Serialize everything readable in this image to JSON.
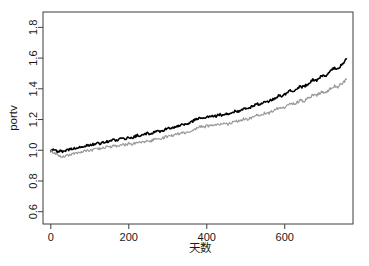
{
  "chart_data": {
    "type": "line",
    "title": "",
    "xlabel": "天数",
    "ylabel": "portv",
    "xlim": [
      -20,
      775
    ],
    "ylim": [
      0.52,
      1.9
    ],
    "xticks": [
      0,
      200,
      400,
      600
    ],
    "xtick_labels": [
      "0",
      "200",
      "400",
      "600"
    ],
    "yticks": [
      0.6,
      0.8,
      1.0,
      1.2,
      1.4,
      1.6,
      1.8
    ],
    "ytick_labels": [
      "0.6",
      "0.8",
      "1.0",
      "1.2",
      "1.4",
      "1.6",
      "1.8"
    ],
    "grid": false,
    "legend": "none",
    "box": true,
    "series": [
      {
        "name": "portv-black",
        "color": "#000000",
        "width": 1.6,
        "x": [
          0,
          8,
          16,
          24,
          32,
          40,
          48,
          56,
          64,
          72,
          80,
          88,
          96,
          104,
          112,
          120,
          128,
          136,
          144,
          152,
          160,
          168,
          176,
          184,
          192,
          200,
          208,
          216,
          224,
          232,
          240,
          248,
          256,
          264,
          272,
          280,
          288,
          296,
          304,
          312,
          320,
          328,
          336,
          344,
          352,
          360,
          368,
          376,
          384,
          392,
          400,
          408,
          416,
          424,
          432,
          440,
          448,
          456,
          464,
          472,
          480,
          488,
          496,
          504,
          512,
          520,
          528,
          536,
          544,
          552,
          560,
          568,
          576,
          584,
          592,
          600,
          608,
          616,
          624,
          632,
          640,
          648,
          656,
          664,
          672,
          680,
          688,
          696,
          704,
          712,
          720,
          728,
          736,
          744,
          752,
          758
        ],
        "y": [
          1.0,
          1.003,
          0.992,
          0.996,
          0.988,
          0.999,
          1.004,
          1.01,
          1.013,
          1.021,
          1.018,
          1.028,
          1.035,
          1.033,
          1.041,
          1.047,
          1.043,
          1.052,
          1.059,
          1.057,
          1.066,
          1.063,
          1.072,
          1.08,
          1.076,
          1.085,
          1.081,
          1.09,
          1.098,
          1.094,
          1.103,
          1.111,
          1.107,
          1.116,
          1.124,
          1.12,
          1.129,
          1.138,
          1.147,
          1.143,
          1.152,
          1.161,
          1.17,
          1.166,
          1.176,
          1.185,
          1.195,
          1.205,
          1.215,
          1.21,
          1.221,
          1.216,
          1.226,
          1.222,
          1.233,
          1.228,
          1.239,
          1.234,
          1.245,
          1.256,
          1.251,
          1.262,
          1.273,
          1.268,
          1.28,
          1.291,
          1.303,
          1.298,
          1.31,
          1.322,
          1.317,
          1.33,
          1.343,
          1.356,
          1.35,
          1.364,
          1.378,
          1.392,
          1.386,
          1.401,
          1.416,
          1.41,
          1.426,
          1.442,
          1.459,
          1.452,
          1.47,
          1.488,
          1.481,
          1.5,
          1.519,
          1.538,
          1.53,
          1.551,
          1.572,
          1.594
        ]
      },
      {
        "name": "portv-grey",
        "color": "#999999",
        "width": 1.2,
        "x": [
          0,
          8,
          16,
          24,
          32,
          40,
          48,
          56,
          64,
          72,
          80,
          88,
          96,
          104,
          112,
          120,
          128,
          136,
          144,
          152,
          160,
          168,
          176,
          184,
          192,
          200,
          208,
          216,
          224,
          232,
          240,
          248,
          256,
          264,
          272,
          280,
          288,
          296,
          304,
          312,
          320,
          328,
          336,
          344,
          352,
          360,
          368,
          376,
          384,
          392,
          400,
          408,
          416,
          424,
          432,
          440,
          448,
          456,
          464,
          472,
          480,
          488,
          496,
          504,
          512,
          520,
          528,
          536,
          544,
          552,
          560,
          568,
          576,
          584,
          592,
          600,
          608,
          616,
          624,
          632,
          640,
          648,
          656,
          664,
          672,
          680,
          688,
          696,
          704,
          712,
          720,
          728,
          736,
          744,
          752,
          758
        ],
        "y": [
          0.995,
          0.985,
          0.972,
          0.964,
          0.958,
          0.966,
          0.972,
          0.978,
          0.982,
          0.989,
          0.986,
          0.995,
          1.001,
          0.999,
          1.006,
          1.012,
          1.008,
          1.016,
          1.022,
          1.019,
          1.027,
          1.024,
          1.032,
          1.039,
          1.035,
          1.043,
          1.039,
          1.047,
          1.054,
          1.05,
          1.058,
          1.065,
          1.061,
          1.069,
          1.076,
          1.072,
          1.08,
          1.088,
          1.096,
          1.092,
          1.1,
          1.108,
          1.116,
          1.112,
          1.12,
          1.128,
          1.137,
          1.146,
          1.155,
          1.15,
          1.159,
          1.155,
          1.164,
          1.16,
          1.169,
          1.165,
          1.174,
          1.17,
          1.18,
          1.189,
          1.185,
          1.195,
          1.205,
          1.2,
          1.21,
          1.22,
          1.23,
          1.226,
          1.236,
          1.246,
          1.242,
          1.253,
          1.264,
          1.275,
          1.27,
          1.282,
          1.294,
          1.306,
          1.3,
          1.312,
          1.325,
          1.319,
          1.332,
          1.345,
          1.359,
          1.353,
          1.367,
          1.382,
          1.376,
          1.391,
          1.406,
          1.421,
          1.414,
          1.43,
          1.446,
          1.462
        ]
      }
    ]
  },
  "axis": {
    "x_title": "天数",
    "y_title": "portv"
  },
  "footer": {
    "clipped_text": ""
  }
}
